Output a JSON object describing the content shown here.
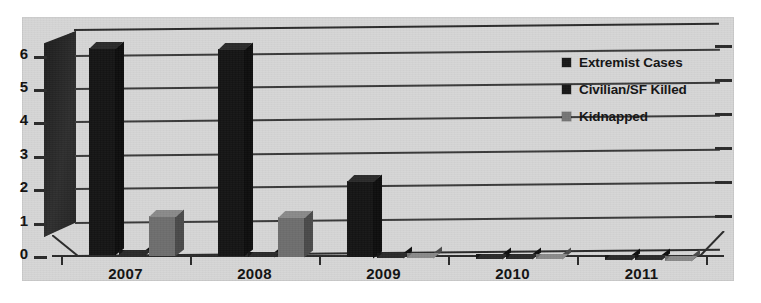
{
  "chart_data": {
    "type": "bar",
    "title": "",
    "subtitle": "",
    "xlabel": "",
    "ylabel": "",
    "categories": [
      "2007",
      "2008",
      "2009",
      "2010",
      "2011"
    ],
    "series": [
      {
        "name": "Extremist Cases",
        "color": "#141414",
        "values": [
          6.2,
          6.2,
          2.3,
          0,
          0
        ]
      },
      {
        "name": "Civilian/SF Killed",
        "color": "#141414",
        "values": [
          0,
          0,
          0,
          0,
          0
        ]
      },
      {
        "name": "Kidnapped",
        "color": "#6e6e6e",
        "values": [
          1.2,
          1.2,
          0,
          0,
          0
        ]
      }
    ],
    "ylim": [
      0,
      6
    ],
    "yticks": [
      "0",
      "1",
      "2",
      "3",
      "4",
      "5",
      "6"
    ],
    "grid": true,
    "legend_position": "top-right",
    "style": "3d-clustered-column-grayscale-scan"
  },
  "axes": {
    "y_tick_labels": [
      "6",
      "5",
      "4",
      "3",
      "2",
      "1",
      "0"
    ],
    "x_tick_labels": [
      "2007",
      "2008",
      "2009",
      "2010",
      "2011"
    ]
  },
  "legend": {
    "items": [
      {
        "label": "Extremist Cases",
        "swatch": "dark"
      },
      {
        "label": "Civilian/SF Killed",
        "swatch": "dark"
      },
      {
        "label": "Kidnapped",
        "swatch": "gray"
      }
    ]
  },
  "colors": {
    "plot_background": "#d6d6d6",
    "page_background": "#ffffff",
    "series_dark": "#141414",
    "series_gray": "#6e6e6e",
    "gridline": "#3a3a3a",
    "text": "#111111"
  }
}
